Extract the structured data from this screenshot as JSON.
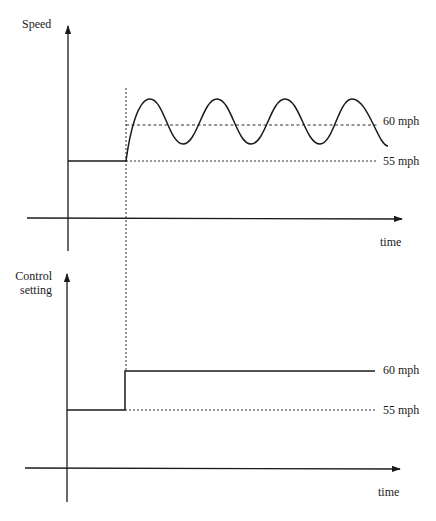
{
  "figure": {
    "width": 436,
    "height": 521,
    "ink_color": "#1a1a1a",
    "background": "#ffffff"
  },
  "top_panel": {
    "y_label": "Speed",
    "x_label": "time",
    "levels": {
      "setpoint_high": "60 mph",
      "setpoint_low": "55 mph"
    },
    "geometry": {
      "y_axis_x": 68,
      "y_axis_top": 26,
      "y_axis_bottom": 251,
      "x_axis_y": 218,
      "x_axis_left": 27,
      "x_axis_right": 402,
      "step_x": 126,
      "low_y": 161,
      "mid_y": 125,
      "peak_y": 99,
      "trough_y": 144,
      "peaks_x": [
        150,
        217,
        285,
        352
      ],
      "troughs_x": [
        183,
        251,
        320
      ],
      "curve_end": [
        388,
        146
      ],
      "dash_right": 378,
      "label_x": 383,
      "label_high_y": 125,
      "label_low_y": 165,
      "x_label_pos": [
        380,
        246
      ]
    }
  },
  "bottom_panel": {
    "y_label_line1": "Control",
    "y_label_line2": "setting",
    "x_label": "time",
    "levels": {
      "setpoint_high": "60 mph",
      "setpoint_low": "55 mph"
    },
    "geometry": {
      "y_axis_x": 67,
      "y_axis_top": 274,
      "y_axis_bottom": 502,
      "x_axis_y": 468,
      "x_axis_left": 25,
      "x_axis_right": 400,
      "step_x": 125,
      "low_y": 410,
      "high_y": 371,
      "line_right": 375,
      "label_x": 383,
      "label_high_y": 374,
      "label_low_y": 414,
      "x_label_pos": [
        378,
        496
      ]
    }
  },
  "shared": {
    "event_line": {
      "x": 126,
      "top": 88,
      "bottom": 371
    }
  }
}
